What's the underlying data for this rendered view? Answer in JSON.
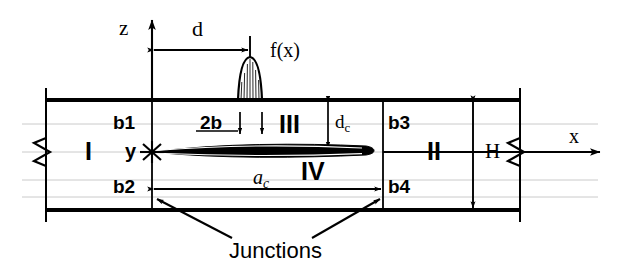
{
  "figure": {
    "type": "engineering-schematic",
    "background_color": "#ffffff",
    "line_color": "#000000",
    "gridline_color": "#b9b9b9"
  },
  "axes": {
    "vertical_label": "z",
    "horizontal_label": "x",
    "origin_label": "y"
  },
  "load": {
    "label": "f(x)",
    "shape": "bell-curve-distributed-load"
  },
  "dimensions": {
    "d": "d",
    "two_b": "2b",
    "d_c_main": "d",
    "d_c_sub": "c",
    "a_c_main": "a",
    "a_c_sub": "c",
    "H": "H"
  },
  "regions": [
    {
      "name": "region-I",
      "label": "I"
    },
    {
      "name": "region-II",
      "label": "II"
    },
    {
      "name": "region-III",
      "label": "III"
    },
    {
      "name": "region-IV",
      "label": "IV"
    }
  ],
  "boundaries": [
    {
      "name": "boundary-b1",
      "label": "b1"
    },
    {
      "name": "boundary-b2",
      "label": "b2"
    },
    {
      "name": "boundary-b3",
      "label": "b3"
    },
    {
      "name": "boundary-b4",
      "label": "b4"
    }
  ],
  "annotations": {
    "junctions": "Junctions"
  }
}
